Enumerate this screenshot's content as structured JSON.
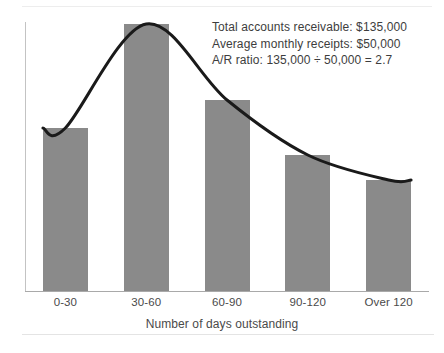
{
  "chart_data": {
    "type": "bar",
    "title": "",
    "subtitle": "",
    "xlabel": "Number of days outstanding",
    "ylabel": "",
    "categories": [
      "0-30",
      "30-60",
      "60-90",
      "90-120",
      "Over 120"
    ],
    "values": [
      163,
      267,
      191,
      136,
      111
    ],
    "ylim": [
      0,
      281
    ],
    "grid": false,
    "legend": "none",
    "series": [
      {
        "name": "Accounts receivable aging",
        "type": "bar",
        "values": [
          163,
          267,
          191,
          136,
          111
        ]
      },
      {
        "name": "Trend curve",
        "type": "line",
        "values": [
          163,
          267,
          191,
          136,
          111
        ]
      }
    ],
    "annotations": [
      "Total accounts receivable: $135,000",
      "Average monthly receipts: $50,000",
      "A/R ratio: 135,000 ÷ 50,000 = 2.7"
    ],
    "colors": {
      "bar_fill": "#8a8a8a",
      "curve": "#1a1a1a",
      "axis": "#a9a9a9",
      "text": "#3d3d3d",
      "background": "#ffffff"
    }
  },
  "annotation": {
    "line1": "Total accounts receivable: $135,000",
    "line2": "Average monthly receipts: $50,000",
    "line3": "A/R ratio: 135,000 ÷ 50,000 = 2.7"
  },
  "axis": {
    "xlabel": "Number of days outstanding",
    "ticks": [
      "0-30",
      "30-60",
      "60-90",
      "90-120",
      "Over 120"
    ]
  }
}
